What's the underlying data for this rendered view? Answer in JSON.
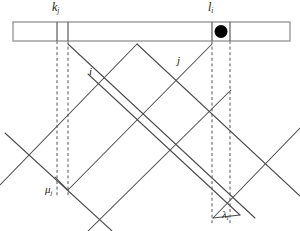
{
  "figure": {
    "background_color": "#ffffff",
    "stroke_color": "#4a4a4a",
    "dash_color": "#555555",
    "marker_color": "#000000",
    "width": 300,
    "height": 231
  },
  "labels": {
    "k": {
      "base": "k",
      "sub": "j"
    },
    "l": {
      "base": "l",
      "sub": "i"
    },
    "i": {
      "base": "i",
      "sub": ""
    },
    "j": {
      "base": "j",
      "sub": ""
    },
    "mu": {
      "base": "μ",
      "sub": "j"
    },
    "lambda": {
      "base": "λ",
      "sub": "i"
    }
  },
  "bar": {
    "name": "horizontal-strip",
    "x": 13,
    "y": 22,
    "width": 277,
    "height": 19,
    "dividers": [
      57,
      68,
      212,
      230
    ],
    "marker": {
      "cx": 221,
      "cy": 31.5,
      "r": 6.5
    }
  },
  "guides": [
    {
      "name": "guide-k-left",
      "x": 57,
      "y1": 41,
      "y2": 196
    },
    {
      "name": "guide-k-right",
      "x": 68,
      "y1": 41,
      "y2": 196
    },
    {
      "name": "guide-l-left",
      "x": 212,
      "y1": 41,
      "y2": 224
    },
    {
      "name": "guide-l-right",
      "x": 230,
      "y1": 41,
      "y2": 224
    }
  ],
  "strip_a": {
    "name": "strip-descending",
    "description": "band of parallel lines running down-right from upper-left",
    "lines": [
      {
        "x1": 5,
        "y1": 133,
        "x2": 112,
        "y2": 231
      },
      {
        "x1": 68,
        "y1": 44,
        "x2": 255,
        "y2": 218
      },
      {
        "x1": 88,
        "y1": 74,
        "x2": 240,
        "y2": 215
      },
      {
        "x1": 137,
        "y1": 44,
        "x2": 300,
        "y2": 196
      }
    ]
  },
  "strip_b": {
    "name": "strip-ascending",
    "description": "band of parallel lines running up-right from lower-left",
    "lines": [
      {
        "x1": 0,
        "y1": 185,
        "x2": 137,
        "y2": 44
      },
      {
        "x1": 68,
        "y1": 190,
        "x2": 212,
        "y2": 44
      },
      {
        "x1": 88,
        "y1": 231,
        "x2": 230,
        "y2": 90
      },
      {
        "x1": 213,
        "y1": 218,
        "x2": 300,
        "y2": 128
      }
    ]
  },
  "vertices": {
    "apex": {
      "x": 137,
      "y": 44
    },
    "mu_point": {
      "x": 68,
      "y": 190
    },
    "lambda_point": {
      "x": 213,
      "y": 218
    }
  }
}
